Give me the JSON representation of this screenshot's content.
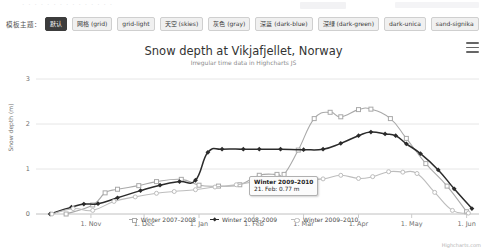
{
  "toolbar": {
    "label": "模板主题：",
    "themes": [
      {
        "name": "default",
        "label": "默认",
        "active": true
      },
      {
        "name": "grid",
        "label": "网格 (grid)",
        "active": false
      },
      {
        "name": "grid-light",
        "label": "grid-light",
        "active": false
      },
      {
        "name": "skies",
        "label": "天空 (skies)",
        "active": false
      },
      {
        "name": "gray",
        "label": "灰色 (gray)",
        "active": false
      },
      {
        "name": "dark-blue",
        "label": "深蓝 (dark-blue)",
        "active": false
      },
      {
        "name": "dark-green",
        "label": "深绿 (dark-green)",
        "active": false
      },
      {
        "name": "dark-unica",
        "label": "dark-unica",
        "active": false
      },
      {
        "name": "sand-signika",
        "label": "sand-signika",
        "active": false
      }
    ]
  },
  "chart": {
    "title": "Snow depth at Vikjafjellet, Norway",
    "subtitle": "Irregular time data in Highcharts JS",
    "menu_icon": "hamburger-menu-icon",
    "credits": "Highcharts.com",
    "tooltip": {
      "title": "Winter 2009–2010",
      "body": "21. Feb: 0.77 m"
    }
  },
  "chart_data": {
    "type": "line",
    "title": "Snow depth at Vikjafjellet, Norway",
    "subtitle": "Irregular time data in Highcharts JS",
    "xlabel": "",
    "ylabel": "Snow depth (m)",
    "ylim": [
      0,
      3
    ],
    "yticks": [
      0,
      1,
      2,
      3
    ],
    "xticks": [
      "1. Nov",
      "1. Dec",
      "1. Jan",
      "1. Feb",
      "1. Mar",
      "1. Apr",
      "1. May",
      "1. Jun"
    ],
    "grid": true,
    "legend_position": "bottom",
    "series": [
      {
        "name": "Winter 2007–2008",
        "color": "#a9a9a9",
        "marker": "square",
        "points": [
          {
            "x": "18. Oct",
            "y": 0.0
          },
          {
            "x": "2. Nov",
            "y": 0.2
          },
          {
            "x": "9. Nov",
            "y": 0.47
          },
          {
            "x": "16. Nov",
            "y": 0.55
          },
          {
            "x": "28. Nov",
            "y": 0.63
          },
          {
            "x": "8. Dec",
            "y": 0.72
          },
          {
            "x": "22. Dec",
            "y": 0.77
          },
          {
            "x": "1. Jan",
            "y": 0.64
          },
          {
            "x": "12. Jan",
            "y": 0.62
          },
          {
            "x": "24. Jan",
            "y": 0.65
          },
          {
            "x": "4. Feb",
            "y": 0.86
          },
          {
            "x": "14. Feb",
            "y": 0.88
          },
          {
            "x": "18. Feb",
            "y": 0.88
          },
          {
            "x": "26. Feb",
            "y": 1.42
          },
          {
            "x": "7. Mar",
            "y": 2.12
          },
          {
            "x": "16. Mar",
            "y": 2.26
          },
          {
            "x": "22. Mar",
            "y": 2.16
          },
          {
            "x": "1. Apr",
            "y": 2.32
          },
          {
            "x": "8. Apr",
            "y": 2.33
          },
          {
            "x": "19. Apr",
            "y": 2.12
          },
          {
            "x": "28. Apr",
            "y": 1.68
          },
          {
            "x": "9. May",
            "y": 1.12
          },
          {
            "x": "21. May",
            "y": 0.62
          },
          {
            "x": "1. Jun",
            "y": 0.05
          }
        ]
      },
      {
        "name": "Winter 2008–2009",
        "color": "#2b2b2b",
        "marker": "diamond",
        "points": [
          {
            "x": "9. Oct",
            "y": 0.0
          },
          {
            "x": "21. Oct",
            "y": 0.15
          },
          {
            "x": "28. Oct",
            "y": 0.22
          },
          {
            "x": "5. Nov",
            "y": 0.23
          },
          {
            "x": "16. Nov",
            "y": 0.36
          },
          {
            "x": "29. Nov",
            "y": 0.52
          },
          {
            "x": "10. Dec",
            "y": 0.64
          },
          {
            "x": "21. Dec",
            "y": 0.72
          },
          {
            "x": "30. Dec",
            "y": 0.75
          },
          {
            "x": "6. Jan",
            "y": 1.37
          },
          {
            "x": "14. Jan",
            "y": 1.44
          },
          {
            "x": "26. Jan",
            "y": 1.44
          },
          {
            "x": "4. Feb",
            "y": 1.44
          },
          {
            "x": "16. Feb",
            "y": 1.44
          },
          {
            "x": "1. Mar",
            "y": 1.43
          },
          {
            "x": "12. Mar",
            "y": 1.44
          },
          {
            "x": "22. Mar",
            "y": 1.57
          },
          {
            "x": "1. Apr",
            "y": 1.74
          },
          {
            "x": "8. Apr",
            "y": 1.82
          },
          {
            "x": "16. Apr",
            "y": 1.78
          },
          {
            "x": "22. Apr",
            "y": 1.74
          },
          {
            "x": "28. Apr",
            "y": 1.56
          },
          {
            "x": "6. May",
            "y": 1.34
          },
          {
            "x": "16. May",
            "y": 0.98
          },
          {
            "x": "25. May",
            "y": 0.56
          },
          {
            "x": "4. Jun",
            "y": 0.12
          }
        ]
      },
      {
        "name": "Winter 2009–2010",
        "color": "#bdbdbd",
        "marker": "circle",
        "points": [
          {
            "x": "10. Oct",
            "y": 0.0
          },
          {
            "x": "22. Oct",
            "y": 0.12
          },
          {
            "x": "2. Nov",
            "y": 0.08
          },
          {
            "x": "14. Nov",
            "y": 0.28
          },
          {
            "x": "26. Nov",
            "y": 0.38
          },
          {
            "x": "8. Dec",
            "y": 0.46
          },
          {
            "x": "18. Dec",
            "y": 0.5
          },
          {
            "x": "30. Dec",
            "y": 0.54
          },
          {
            "x": "10. Jan",
            "y": 0.6
          },
          {
            "x": "22. Jan",
            "y": 0.65
          },
          {
            "x": "2. Feb",
            "y": 0.72
          },
          {
            "x": "12. Feb",
            "y": 0.74
          },
          {
            "x": "21. Feb",
            "y": 0.77
          },
          {
            "x": "1. Mar",
            "y": 0.78
          },
          {
            "x": "12. Mar",
            "y": 0.78
          },
          {
            "x": "22. Mar",
            "y": 0.86
          },
          {
            "x": "1. Apr",
            "y": 0.79
          },
          {
            "x": "9. Apr",
            "y": 0.83
          },
          {
            "x": "18. Apr",
            "y": 0.94
          },
          {
            "x": "26. Apr",
            "y": 0.93
          },
          {
            "x": "4. May",
            "y": 0.9
          },
          {
            "x": "14. May",
            "y": 0.48
          },
          {
            "x": "24. May",
            "y": 0.08
          },
          {
            "x": "2. Jun",
            "y": 0.02
          }
        ]
      }
    ]
  }
}
